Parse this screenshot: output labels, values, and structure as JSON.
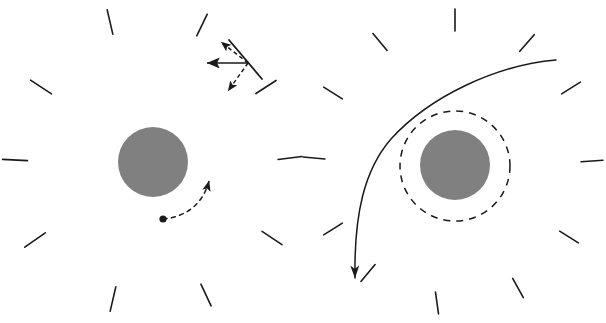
{
  "figure": {
    "width": 606,
    "height": 323,
    "background": "#ffffff",
    "panels": [
      {
        "id": "left-panel",
        "name": "left-panel",
        "description": "Shear field tick marks around a gray mass with an orbiting test particle and a vector decomposition inset",
        "center": {
          "x": 153,
          "y": 162
        }
      },
      {
        "id": "right-panel",
        "name": "right-panel",
        "description": "Shear field tick marks around a gray mass with a dashed boundary circle and a deflected trajectory",
        "center": {
          "x": 455,
          "y": 165
        }
      }
    ]
  },
  "colors": {
    "sphere_fill": "#808080",
    "stroke": "#1a1a1a",
    "background": "#ffffff"
  },
  "style": {
    "tick_stroke_width": 1.6,
    "tick_length": 22,
    "dashed_circle_stroke_width": 1.5,
    "dashed_circle_dasharray": "7 6",
    "trajectory_stroke_width": 1.5,
    "orbit_dasharray": "4 4.5",
    "vector_stroke_width": 1.6,
    "vector_dasharray": "4 3"
  },
  "left_panel": {
    "sphere": {
      "cx": 153,
      "cy": 162,
      "r": 35,
      "fill": "#808080"
    },
    "ticks": [
      {
        "cx": 110,
        "cy": 22,
        "angle": -13,
        "length": 25
      },
      {
        "cx": 202,
        "cy": 25,
        "angle": 26,
        "length": 24
      },
      {
        "cx": 41,
        "cy": 87,
        "angle": -57,
        "length": 25
      },
      {
        "cx": 266,
        "cy": 87,
        "angle": 57,
        "length": 24
      },
      {
        "cx": 15,
        "cy": 160,
        "angle": -87,
        "length": 25
      },
      {
        "cx": 290,
        "cy": 158,
        "angle": 83,
        "length": 24
      },
      {
        "cx": 35,
        "cy": 240,
        "angle": -125,
        "length": 25
      },
      {
        "cx": 272,
        "cy": 238,
        "angle": 124,
        "length": 24
      },
      {
        "cx": 113,
        "cy": 299,
        "angle": -167,
        "length": 25
      },
      {
        "cx": 206,
        "cy": 295,
        "angle": 155,
        "length": 24
      }
    ],
    "orbit": {
      "name": "test-particle-orbit",
      "path": "M 163 219 C 186 217 203 204 209 181",
      "dasharray": "4 4.5",
      "start_dot": {
        "cx": 163,
        "cy": 219,
        "r": 3.6
      },
      "arrow_tip": {
        "x": 210,
        "y": 166
      },
      "direction": "counterclockwise"
    },
    "vector_inset": {
      "name": "vector-decomposition",
      "origin": {
        "x": 248,
        "y": 63
      },
      "tick_line": {
        "x1": 229,
        "y1": 40,
        "x2": 262,
        "y2": 79,
        "angle": 50
      },
      "arrows": [
        {
          "name": "radial-vector-solid",
          "style": "solid",
          "x1": 248,
          "y1": 63,
          "x2": 207,
          "y2": 63,
          "label": "solid horizontal arrow pointing left"
        },
        {
          "name": "shear-component-upper-dashed",
          "style": "dashed",
          "x1": 248,
          "y1": 63,
          "x2": 221,
          "y2": 42,
          "label": "dashed arrow pointing up-left"
        },
        {
          "name": "shear-component-lower-dashed",
          "style": "dashed",
          "x1": 248,
          "y1": 63,
          "x2": 228,
          "y2": 91,
          "label": "dashed arrow pointing down-left"
        }
      ]
    }
  },
  "right_panel": {
    "sphere": {
      "cx": 455,
      "cy": 165,
      "r": 35,
      "fill": "#808080"
    },
    "dashed_circle": {
      "cx": 455,
      "cy": 166,
      "r": 55,
      "dasharray": "7 6"
    },
    "ticks": [
      {
        "cx": 455,
        "cy": 20,
        "angle": 0,
        "length": 22
      },
      {
        "cx": 380,
        "cy": 42,
        "angle": -40,
        "length": 22
      },
      {
        "cx": 527,
        "cy": 43,
        "angle": 41,
        "length": 22
      },
      {
        "cx": 333,
        "cy": 93,
        "angle": -58,
        "length": 22
      },
      {
        "cx": 571,
        "cy": 88,
        "angle": 58,
        "length": 22
      },
      {
        "cx": 314,
        "cy": 158,
        "angle": -85,
        "length": 22
      },
      {
        "cx": 592,
        "cy": 161,
        "angle": 86,
        "length": 22
      },
      {
        "cx": 333,
        "cy": 229,
        "angle": -122,
        "length": 22
      },
      {
        "cx": 569,
        "cy": 237,
        "angle": 122,
        "length": 22
      },
      {
        "cx": 368,
        "cy": 273,
        "angle": -140,
        "length": 22
      },
      {
        "cx": 518,
        "cy": 288,
        "angle": 151,
        "length": 22
      },
      {
        "cx": 437,
        "cy": 303,
        "angle": 172,
        "length": 22
      }
    ],
    "trajectory": {
      "name": "deflected-trajectory",
      "path": "M 556 60 C 497 65 430 96 391 139 C 364 170 354 215 355 278",
      "arrow_tip": {
        "x": 355,
        "y": 293
      },
      "direction": "incoming from upper right, deflected downward"
    }
  }
}
